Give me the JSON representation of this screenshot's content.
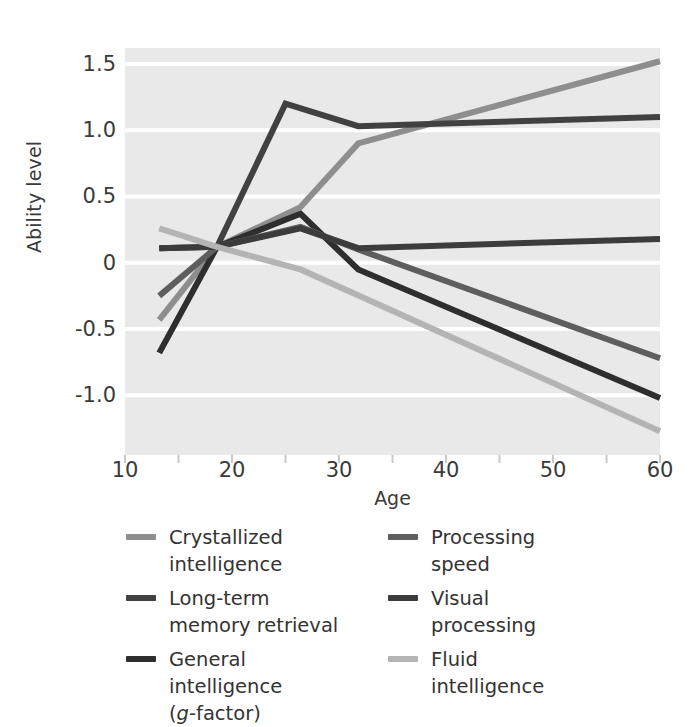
{
  "chart_data": {
    "type": "line",
    "title": "",
    "xlabel": "Age",
    "ylabel": "Ability level",
    "xlim": [
      10,
      60
    ],
    "ylim": [
      -1.45,
      1.62
    ],
    "xticks": [
      10,
      20,
      30,
      40,
      50,
      60
    ],
    "xticklabels": [
      "10",
      "20",
      "30",
      "40",
      "50",
      "60"
    ],
    "xminorticks": [
      15,
      25,
      35,
      45,
      55
    ],
    "yticks": [
      1.5,
      1.0,
      0.5,
      0,
      -0.5,
      -1.0
    ],
    "yticklabels": [
      "1.5",
      "1.0",
      "0.5",
      "0",
      "-0.5",
      "-1.0"
    ],
    "grid": "horizontal-white-on-gray",
    "plot_background": "#e9e9e9",
    "gridline_color": "#ffffff",
    "legend_position": "below-two-columns",
    "series": [
      {
        "name": "Crystallized intelligence",
        "color": "#8e8e8e",
        "x": [
          13.2,
          18.6,
          26.4,
          31.8,
          60.0
        ],
        "y": [
          -0.43,
          0.12,
          0.42,
          0.9,
          1.52
        ]
      },
      {
        "name": "Long-term memory retrieval",
        "color": "#414141",
        "x": [
          13.2,
          18.6,
          25.0,
          31.8,
          60.0
        ],
        "y": [
          0.11,
          0.12,
          1.2,
          1.03,
          1.1
        ]
      },
      {
        "name": "General intelligence (g-factor)",
        "color": "#2e2e2e",
        "x": [
          13.2,
          18.6,
          26.4,
          31.8,
          60.0
        ],
        "y": [
          -0.68,
          0.12,
          0.37,
          -0.05,
          -1.02
        ]
      },
      {
        "name": "Processing speed",
        "color": "#5e5e5e",
        "x": [
          13.2,
          18.6,
          26.4,
          31.8,
          60.0
        ],
        "y": [
          -0.25,
          0.12,
          0.27,
          0.1,
          -0.72
        ]
      },
      {
        "name": "Visual processing",
        "color": "#3c3c3c",
        "x": [
          13.2,
          18.6,
          26.4,
          31.8,
          60.0
        ],
        "y": [
          0.11,
          0.12,
          0.26,
          0.11,
          0.18
        ]
      },
      {
        "name": "Fluid intelligence",
        "color": "#b4b4b4",
        "x": [
          13.2,
          18.6,
          26.4,
          60.0
        ],
        "y": [
          0.26,
          0.12,
          -0.05,
          -1.27
        ]
      }
    ]
  },
  "axes": {
    "y_title": "Ability level",
    "x_title": "Age"
  },
  "legend": {
    "column_left": [
      {
        "label": "Crystallized intelligence",
        "line1": "Crystallized",
        "line2": "intelligence",
        "line3": "",
        "color": "#8e8e8e"
      },
      {
        "label": "Long-term memory retrieval",
        "line1": "Long-term",
        "line2": "memory retrieval",
        "line3": "",
        "color": "#414141"
      },
      {
        "label": "General intelligence (g-factor)",
        "line1": "General",
        "line2": "intelligence",
        "line3": "(g-factor)",
        "color": "#2e2e2e"
      }
    ],
    "column_right": [
      {
        "label": "Processing speed",
        "line1": "Processing",
        "line2": "speed",
        "line3": "",
        "color": "#5e5e5e"
      },
      {
        "label": "Visual processing",
        "line1": "Visual",
        "line2": "processing",
        "line3": "",
        "color": "#3c3c3c"
      },
      {
        "label": "Fluid intelligence",
        "line1": "Fluid",
        "line2": "intelligence",
        "line3": "",
        "color": "#b4b4b4"
      }
    ]
  }
}
